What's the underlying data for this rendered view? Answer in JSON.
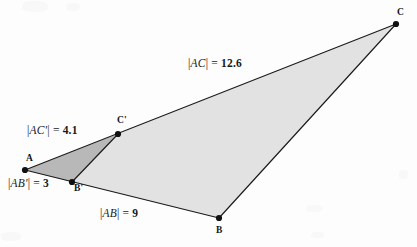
{
  "figure": {
    "background_color": "#fdfdfd",
    "stroke_color": "#1a1a1a",
    "inner_triangle_fill": "#b8b8b8",
    "outer_region_fill": "#e2e2e2",
    "vertex_dot_color": "#111111"
  },
  "points": {
    "A": {
      "label": "A",
      "x": 25,
      "y": 170
    },
    "B": {
      "label": "B",
      "x": 219,
      "y": 218
    },
    "C": {
      "label": "C",
      "x": 396,
      "y": 24
    },
    "Bprime": {
      "label": "B'",
      "x": 72,
      "y": 182
    },
    "Cprime": {
      "label": "C'",
      "x": 118,
      "y": 134
    }
  },
  "measurements": [
    {
      "id": "ac",
      "segment": "AC",
      "segment_text": "AC",
      "value": "12.6",
      "full_text": "|AC| = 12.6"
    },
    {
      "id": "acp",
      "segment": "AC'",
      "segment_text": "AC'",
      "value": "4.1",
      "full_text": "|AC'| = 4.1"
    },
    {
      "id": "abp",
      "segment": "AB'",
      "segment_text": "AB'",
      "value": "3",
      "full_text": "|AB'| = 3"
    },
    {
      "id": "ab",
      "segment": "AB",
      "segment_text": "AB",
      "value": "9",
      "full_text": "|AB| = 9"
    }
  ],
  "symbols": {
    "vertical_bar": "|",
    "equals": "="
  },
  "chart_data": {
    "type": "diagram",
    "subtype": "euclidean-geometry-similar-triangles",
    "vertices": [
      {
        "name": "A",
        "x": 25,
        "y": 170
      },
      {
        "name": "B",
        "x": 219,
        "y": 218
      },
      {
        "name": "C",
        "x": 396,
        "y": 24
      },
      {
        "name": "B'",
        "x": 72,
        "y": 182
      },
      {
        "name": "C'",
        "x": 118,
        "y": 134
      }
    ],
    "polygons": [
      {
        "name": "triangle-ABprimeCprime",
        "vertices": [
          "A",
          "B'",
          "C'"
        ],
        "fill": "#b8b8b8"
      },
      {
        "name": "quadrilateral-BprimeBCCprime",
        "vertices": [
          "B'",
          "B",
          "C",
          "C'"
        ],
        "fill": "#e2e2e2"
      }
    ],
    "edges": [
      {
        "from": "A",
        "to": "B"
      },
      {
        "from": "A",
        "to": "C"
      },
      {
        "from": "B",
        "to": "C"
      },
      {
        "from": "B'",
        "to": "C'"
      }
    ],
    "labeled_lengths": [
      {
        "segment": "AC",
        "value": 12.6
      },
      {
        "segment": "AC'",
        "value": 4.1
      },
      {
        "segment": "AB'",
        "value": 3
      },
      {
        "segment": "AB",
        "value": 9
      }
    ]
  }
}
